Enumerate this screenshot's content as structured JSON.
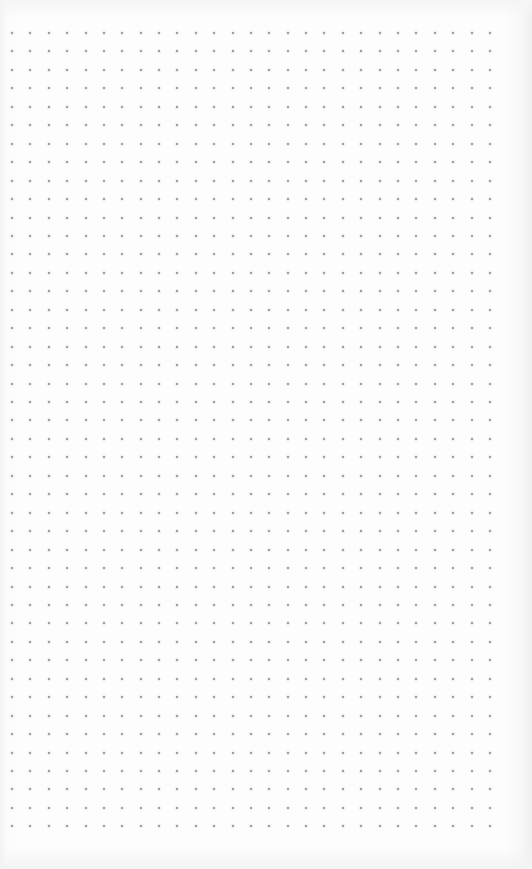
{
  "page": {
    "type": "dot-grid-paper",
    "background_color": "#fdfdfd",
    "dot_color": "#8c8c8c"
  },
  "dot_grid": {
    "columns": 27,
    "rows": 44,
    "origin_x": 12,
    "origin_y": 33,
    "spacing_x": 18.38,
    "spacing_y": 18.45,
    "dot_size": 2
  }
}
